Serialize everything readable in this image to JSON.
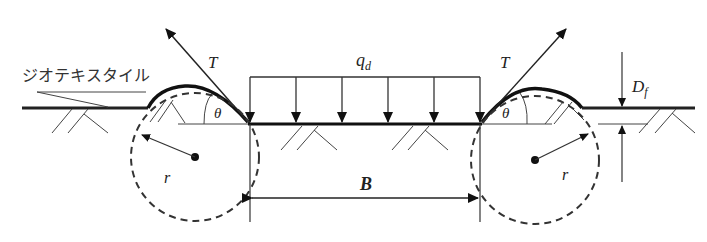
{
  "diagram": {
    "title": "",
    "labels": {
      "geotextile": "ジオテキスタイル",
      "tension_left": "T",
      "tension_right": "T",
      "load": "q",
      "load_subscript": "d",
      "angle_left": "θ",
      "angle_right": "θ",
      "radius_left": "r",
      "radius_right": "r",
      "width": "B",
      "depth": "D",
      "depth_subscript": "f"
    },
    "colors": {
      "line": "#222222",
      "thin_line": "#444444",
      "background": "#ffffff"
    },
    "load_arrows_count": 6
  }
}
